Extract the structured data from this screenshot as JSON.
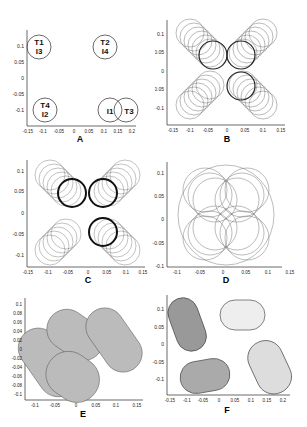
{
  "figure": {
    "panels": [
      {
        "id": "A",
        "label": "A",
        "xticks": [
          "-0.15",
          "-0.1",
          "-0.05",
          "0",
          "0.05",
          "0.1",
          "0.15",
          "0.2"
        ],
        "yticks": [
          "0.1",
          "0.05",
          "0",
          "-0.05",
          "-0.1"
        ],
        "circles": [
          {
            "cx": -0.1,
            "cy": 0.1,
            "r": 0.03,
            "text": [
              "T1",
              "I3"
            ]
          },
          {
            "cx": 0.1,
            "cy": 0.1,
            "r": 0.03,
            "text": [
              "T2",
              "I4"
            ]
          },
          {
            "cx": -0.09,
            "cy": -0.1,
            "r": 0.03,
            "text": [
              "T4",
              "I2"
            ]
          },
          {
            "cx": 0.12,
            "cy": -0.1,
            "r": 0.03,
            "text": [
              "I1"
            ]
          },
          {
            "cx": 0.17,
            "cy": -0.1,
            "r": 0.03,
            "text": [
              "T3"
            ]
          }
        ]
      },
      {
        "id": "B",
        "label": "B",
        "xticks": [
          "-0.15",
          "-0.1",
          "-0.05",
          "0",
          "0.05",
          "0.1",
          "0.15"
        ],
        "yticks": [
          "0.1",
          "0.05",
          "0",
          "-0.05",
          "-0.1"
        ]
      },
      {
        "id": "C",
        "label": "C",
        "xticks": [
          "-0.15",
          "-0.1",
          "-0.05",
          "0",
          "0.05",
          "0.1",
          "0.15"
        ],
        "yticks": [
          "0.1",
          "0.05",
          "0",
          "-0.05",
          "-0.1"
        ]
      },
      {
        "id": "D",
        "label": "D",
        "xticks": [
          "-0.1",
          "-0.05",
          "0",
          "0.05",
          "0.1",
          "0.15"
        ],
        "yticks": [
          "0.1",
          "0.05",
          "0",
          "-0.05",
          "-0.1"
        ]
      },
      {
        "id": "E",
        "label": "E",
        "xticks": [
          "-0.1",
          "-0.05",
          "0",
          "0.05",
          "0.1",
          "0.15"
        ],
        "yticks": [
          "0.1",
          "0.08",
          "0.06",
          "0.04",
          "0.02",
          "0",
          "-0.02",
          "-0.04",
          "-0.06",
          "-0.08",
          "-0.1"
        ]
      },
      {
        "id": "F",
        "label": "F",
        "xticks": [
          "-0.15",
          "-0.1",
          "-0.05",
          "0",
          "0.05",
          "0.1",
          "0.15",
          "0.2"
        ],
        "yticks": [
          "0.1",
          "0.05",
          "0",
          "-0.05",
          "-0.1"
        ]
      }
    ]
  }
}
